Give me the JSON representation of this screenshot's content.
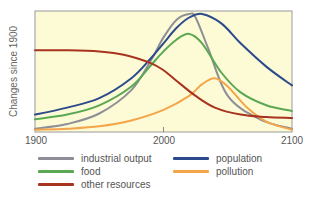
{
  "chart_data": {
    "type": "line",
    "title": "",
    "xlabel": "",
    "ylabel": "Changes since 1900",
    "xlim": [
      1900,
      2100
    ],
    "ylim": [
      0,
      100
    ],
    "x_ticks": [
      "1900",
      "2000",
      "2100"
    ],
    "grid": false,
    "legend_position": "bottom",
    "background": "#fdfbd6",
    "series": [
      {
        "name": "industrial output",
        "color": "#8e8e96",
        "x": [
          1900,
          1925,
          1950,
          1975,
          1990,
          2000,
          2010,
          2020,
          2025,
          2035,
          2050,
          2075,
          2100
        ],
        "values": [
          2,
          6,
          15,
          35,
          60,
          80,
          95,
          100,
          97,
          70,
          30,
          10,
          2
        ]
      },
      {
        "name": "population",
        "color": "#2c4a8c",
        "x": [
          1900,
          1925,
          1950,
          1975,
          1990,
          2000,
          2010,
          2020,
          2030,
          2045,
          2060,
          2080,
          2100
        ],
        "values": [
          14,
          20,
          28,
          45,
          62,
          75,
          88,
          97,
          100,
          92,
          75,
          55,
          39
        ]
      },
      {
        "name": "food",
        "color": "#5aa853",
        "x": [
          1900,
          1925,
          1950,
          1975,
          1990,
          2000,
          2010,
          2020,
          2030,
          2045,
          2060,
          2080,
          2100
        ],
        "values": [
          10,
          14,
          22,
          38,
          56,
          68,
          78,
          83,
          75,
          50,
          33,
          22,
          17
        ]
      },
      {
        "name": "pollution",
        "color": "#f4a54a",
        "x": [
          1900,
          1925,
          1950,
          1975,
          2000,
          2020,
          2030,
          2040,
          2050,
          2065,
          2080,
          2100
        ],
        "values": [
          1,
          2,
          4,
          9,
          18,
          30,
          40,
          45,
          38,
          20,
          8,
          1
        ]
      },
      {
        "name": "other resources",
        "color": "#a8331f",
        "x": [
          1900,
          1925,
          1950,
          1970,
          1990,
          2000,
          2010,
          2025,
          2040,
          2060,
          2080,
          2100
        ],
        "values": [
          69,
          69,
          68,
          65,
          58,
          52,
          43,
          30,
          20,
          14,
          12,
          11
        ]
      }
    ]
  },
  "legend": {
    "items": [
      {
        "label": "industrial output",
        "color": "#8e8e96"
      },
      {
        "label": "population",
        "color": "#2c4a8c"
      },
      {
        "label": "food",
        "color": "#5aa853"
      },
      {
        "label": "pollution",
        "color": "#f4a54a"
      },
      {
        "label": "other resources",
        "color": "#a8331f"
      }
    ]
  }
}
